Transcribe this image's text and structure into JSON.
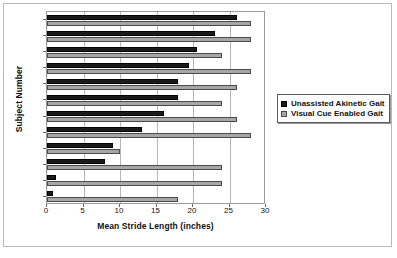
{
  "chart_data": {
    "type": "bar",
    "orientation": "horizontal",
    "title": "",
    "xlabel": "Mean Stride Length (inches)",
    "ylabel": "Subject Number",
    "xlim": [
      0,
      30
    ],
    "xticks": [
      0,
      5,
      10,
      15,
      20,
      25,
      30
    ],
    "grid": true,
    "legend_position": "right",
    "categories": [
      "1",
      "2",
      "3",
      "4",
      "5",
      "6",
      "7",
      "8",
      "9",
      "10",
      "11",
      "12"
    ],
    "series": [
      {
        "name": "Unassisted Akinetic Gait",
        "color": "#1a1a1a",
        "values": [
          0.8,
          1.2,
          8,
          9,
          13,
          16,
          18,
          18,
          19.5,
          20.5,
          23,
          26
        ]
      },
      {
        "name": "Visual Cue Enabled Gait",
        "color": "#a6a6a6",
        "values": [
          18,
          24,
          24,
          10,
          28,
          26,
          24,
          26,
          28,
          24,
          28,
          28
        ]
      }
    ]
  },
  "legend": {
    "items": [
      {
        "label": "Unassisted Akinetic Gait",
        "swatch": "dark"
      },
      {
        "label": "Visual Cue Enabled Gait",
        "swatch": "light"
      }
    ]
  }
}
